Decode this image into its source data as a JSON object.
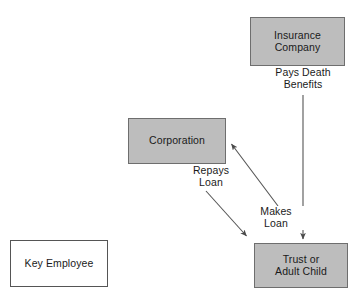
{
  "diagram": {
    "canvas": {
      "width": 364,
      "height": 306,
      "background": "#ffffff"
    },
    "colors": {
      "node_fill": "#bdbdbd",
      "node_stroke": "#6e6e6e",
      "outline_node_fill": "#ffffff",
      "outline_node_stroke": "#555555",
      "edge_stroke": "#555555",
      "text": "#1a1a1a"
    },
    "nodes": [
      {
        "id": "insurance-company",
        "label": "Insurance\nCompany",
        "style": "filled",
        "x": 250,
        "y": 17,
        "w": 95,
        "h": 49
      },
      {
        "id": "corporation",
        "label": "Corporation",
        "style": "filled",
        "x": 128,
        "y": 118,
        "w": 98,
        "h": 46
      },
      {
        "id": "trust-adult-child",
        "label": "Trust or\nAdult Child",
        "style": "filled",
        "x": 254,
        "y": 243,
        "w": 94,
        "h": 45
      },
      {
        "id": "key-employee",
        "label": "Key Employee",
        "style": "outline",
        "x": 10,
        "y": 240,
        "w": 98,
        "h": 47
      }
    ],
    "edges": [
      {
        "id": "pays-death-benefits",
        "label": "Pays Death\nBenefits",
        "from": "insurance-company",
        "to": "trust-adult-child",
        "shape": "vertical",
        "x1": 303,
        "y1": 95,
        "x2": 303,
        "y2": 241
      },
      {
        "id": "makes-loan",
        "label": "Makes\nLoan",
        "from": "trust-adult-child",
        "to": "corporation",
        "shape": "diagonal",
        "x1": 277,
        "y1": 204,
        "x2": 230,
        "y2": 143
      },
      {
        "id": "repays-loan",
        "label": "Repays\nLoan",
        "from": "corporation",
        "to": "trust-adult-child",
        "shape": "diagonal",
        "x1": 207,
        "y1": 192,
        "x2": 248,
        "y2": 238
      }
    ]
  }
}
